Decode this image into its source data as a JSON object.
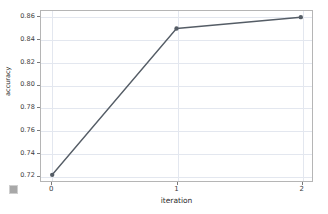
{
  "chart_data": {
    "type": "line",
    "title": "",
    "xlabel": "iteration",
    "ylabel": "accuracy",
    "x": [
      0,
      1,
      2
    ],
    "values": [
      0.72,
      0.85,
      0.86
    ],
    "series": [
      {
        "name": "accuracy",
        "values": [
          0.72,
          0.85,
          0.86
        ]
      }
    ],
    "xlim": [
      -0.09,
      2.09
    ],
    "ylim": [
      0.7145,
      0.8655
    ],
    "xticks": [
      0,
      1,
      2
    ],
    "xtick_labels": [
      "0",
      "1",
      "2"
    ],
    "yticks": [
      0.72,
      0.74,
      0.76,
      0.78,
      0.8,
      0.82,
      0.84,
      0.86
    ],
    "ytick_labels": [
      "0.72",
      "0.74",
      "0.76",
      "0.78",
      "0.80",
      "0.82",
      "0.84",
      "0.86"
    ],
    "grid": true,
    "legend": null,
    "marker": "circle",
    "line_color": "#555d66",
    "grid_color": "#e3e7ef",
    "frame_color": "#b5b5b5",
    "background": "#ffffff"
  },
  "figure": {
    "corner_glyph_name": "resize-handle-icon"
  }
}
